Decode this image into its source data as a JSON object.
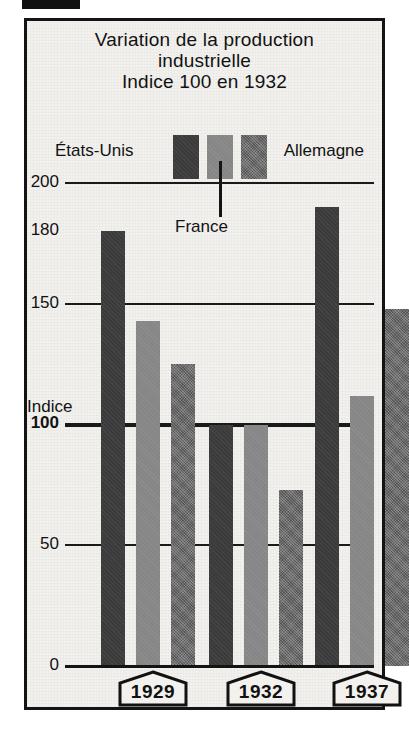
{
  "figure": {
    "corner_marker": "black-marker-block"
  },
  "title": {
    "lines": [
      "Variation de la production",
      "industrielle",
      "Indice 100 en 1932"
    ]
  },
  "legend": {
    "position": "top",
    "entries": [
      {
        "label": "États-Unis",
        "color": "#3b3b3b",
        "swatch": "legend-swatch-us"
      },
      {
        "label": "France",
        "color": "#868686",
        "swatch": "legend-swatch-fr"
      },
      {
        "label": "Allemagne",
        "color": "#656565",
        "swatch": "legend-swatch-de"
      }
    ]
  },
  "axis": {
    "y_caption": "Indice",
    "ticks": [
      {
        "label": "200",
        "value": 200,
        "bold": false
      },
      {
        "label": "180",
        "value": 180,
        "bold": false
      },
      {
        "label": "150",
        "value": 150,
        "bold": false
      },
      {
        "label": "100",
        "value": 100,
        "bold": true
      },
      {
        "label": "50",
        "value": 50,
        "bold": false
      },
      {
        "label": "0",
        "value": 0,
        "bold": false
      }
    ]
  },
  "years": [
    {
      "label": "1929"
    },
    {
      "label": "1932"
    },
    {
      "label": "1937"
    }
  ],
  "chart_data": {
    "type": "bar",
    "xlabel": "",
    "ylabel": "Indice",
    "ylim": [
      0,
      200
    ],
    "yticks": [
      0,
      50,
      100,
      150,
      180,
      200
    ],
    "grid": true,
    "legend_position": "top",
    "categories": [
      "1929",
      "1932",
      "1937"
    ],
    "series": [
      {
        "name": "États-Unis",
        "color": "#3b3b3b",
        "values": [
          180,
          100,
          190
        ]
      },
      {
        "name": "France",
        "color": "#868686",
        "values": [
          143,
          100,
          112
        ]
      },
      {
        "name": "Allemagne",
        "color": "#656565",
        "values": [
          125,
          73,
          148
        ]
      }
    ]
  }
}
